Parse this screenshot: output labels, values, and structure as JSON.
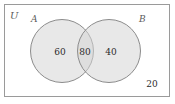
{
  "figure": {
    "type": "venn-diagram",
    "width": 175,
    "height": 104,
    "background_color": "#ffffff"
  },
  "universe": {
    "label": "U",
    "border_color": "#9a9a9a",
    "outside_value": "20"
  },
  "sets": [
    {
      "key": "A",
      "label": "A",
      "only_value": "60",
      "fill_color": "#d6d6d6",
      "stroke_color": "#8c8c8c"
    },
    {
      "key": "B",
      "label": "B",
      "only_value": "40",
      "fill_color": "#d6d6d6",
      "stroke_color": "#8c8c8c"
    }
  ],
  "intersection": {
    "label": "A and B",
    "value": "80"
  },
  "chart_data": {
    "type": "venn",
    "title": "",
    "universe_label": "U",
    "set_labels": [
      "A",
      "B"
    ],
    "regions": [
      {
        "name": "A only",
        "label": "60",
        "value": 60
      },
      {
        "name": "A and B",
        "label": "80",
        "value": 80
      },
      {
        "name": "B only",
        "label": "40",
        "value": 40
      },
      {
        "name": "outside A and B",
        "label": "20",
        "value": 20
      }
    ],
    "totals": {
      "A": 140,
      "B": 120,
      "universe": 200
    }
  }
}
